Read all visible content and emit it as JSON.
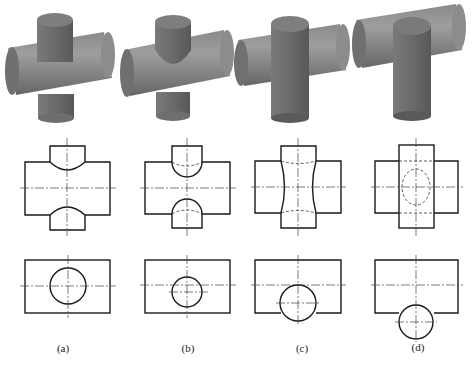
{
  "figure": {
    "panels": [
      {
        "id": "a",
        "label": "(a)",
        "description": "Vertical cylinder smaller than horizontal cylinder; intersection curves bow toward horizontal axis"
      },
      {
        "id": "b",
        "label": "(b)",
        "description": "Vertical cylinder smaller, offset; deeper intersection curves with hidden (dashed) arcs"
      },
      {
        "id": "c",
        "label": "(c)",
        "description": "Cylinders of nearly equal diameter, vertical offset; wavy intersection on both sides"
      },
      {
        "id": "d",
        "label": "(d)",
        "description": "Vertical cylinder larger than horizontal; intersection shown as dashed ellipse"
      }
    ],
    "rows": [
      "3D shaded view",
      "Front view",
      "Top view"
    ],
    "colors": {
      "shade_light": "#9a9a9a",
      "shade_dark": "#5e5e5e",
      "line": "#1a1a1a",
      "background": "#ffffff"
    }
  }
}
